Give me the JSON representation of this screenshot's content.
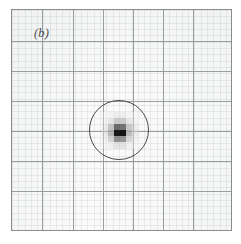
{
  "figure": {
    "panel_label": "(b)",
    "label_position": {
      "x_px": 34,
      "y_px": 26
    },
    "frame": {
      "left_px": 11,
      "top_px": 9,
      "width_px": 221,
      "height_px": 222,
      "border_color": "#8c8c8c",
      "background_color": "#fbfbfb"
    },
    "colors": {
      "major_gridline": "#9b9ea0",
      "minor_gridline": "rgba(150,155,158,0.16)",
      "aperture_outline": "#4a4a4a",
      "label_text": "#4d4d4d",
      "paper_white": "#ffffff"
    }
  },
  "chart_data": {
    "type": "heatmap",
    "title": "(b)",
    "xlabel": "",
    "ylabel": "",
    "grid": true,
    "legend": "none",
    "grid_columns": 7,
    "grid_rows": 7,
    "xlim": [
      0,
      7
    ],
    "ylim": [
      0,
      7
    ],
    "major_gridlines_x_px": [
      11,
      41,
      72,
      102,
      132,
      162,
      192,
      232
    ],
    "major_gridlines_y_px": [
      9,
      40,
      70,
      100,
      130,
      160,
      190,
      231
    ],
    "minor_subdivisions_per_cell": 5,
    "aperture": {
      "shape": "circle",
      "center_x_px": 118,
      "center_y_px": 129,
      "radius_px": 30,
      "center_x_data": 3.55,
      "center_y_data": 3.43,
      "radius_data": 0.98
    },
    "source": {
      "name": "pixelated-point-source",
      "left_px": 101,
      "top_px": 111,
      "pixel_size_px": 6.1,
      "columns": 6,
      "rows": 6,
      "min_value": 0.0,
      "max_value": 1.0,
      "values": [
        [
          0.05,
          0.08,
          0.12,
          0.12,
          0.07,
          0.04
        ],
        [
          0.08,
          0.16,
          0.3,
          0.29,
          0.15,
          0.07
        ],
        [
          0.13,
          0.33,
          0.62,
          0.6,
          0.31,
          0.12
        ],
        [
          0.14,
          0.38,
          0.93,
          0.95,
          0.36,
          0.13
        ],
        [
          0.1,
          0.26,
          0.52,
          0.5,
          0.25,
          0.1
        ],
        [
          0.05,
          0.11,
          0.19,
          0.18,
          0.1,
          0.05
        ]
      ]
    }
  }
}
